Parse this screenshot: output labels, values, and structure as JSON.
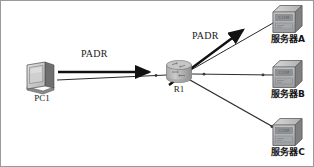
{
  "diagram": {
    "type": "network-topology",
    "width": 314,
    "height": 167,
    "background_color": "#ffffff",
    "border_color": "#9a9a9a"
  },
  "nodes": {
    "pc": {
      "label": "PC1",
      "icon": "desktop-computer-icon",
      "x": 40,
      "y": 75
    },
    "router": {
      "label": "R1",
      "icon": "router-cylinder-icon",
      "x": 178,
      "y": 72
    },
    "server_a": {
      "label": "服务器A",
      "icon": "server-box-icon",
      "face_text": "COM",
      "x": 286,
      "y": 18
    },
    "server_b": {
      "label": "服务器B",
      "icon": "server-box-icon",
      "face_text": "COM",
      "x": 286,
      "y": 73
    },
    "server_c": {
      "label": "服务器C",
      "icon": "server-box-icon",
      "face_text": "COM",
      "x": 286,
      "y": 131
    }
  },
  "flows": [
    {
      "id": "flow-pc-to-router",
      "label": "PADR",
      "from": "pc",
      "to": "router",
      "label_x": 83,
      "label_y": 52
    },
    {
      "id": "flow-router-to-server-a",
      "label": "PADR",
      "from": "router",
      "to": "server_a",
      "label_x": 192,
      "label_y": 33
    }
  ],
  "links": [
    {
      "id": "link-pc-router",
      "from": "pc",
      "to": "router"
    },
    {
      "id": "link-router-server-a",
      "from": "router",
      "to": "server_a"
    },
    {
      "id": "link-router-server-b",
      "from": "router",
      "to": "server_b"
    },
    {
      "id": "link-router-server-c",
      "from": "router",
      "to": "server_c"
    }
  ],
  "colors": {
    "line": "#2b2b2b",
    "arrow": "#111111",
    "device_body": "#b8b8b8",
    "device_shade": "#8e8e8e",
    "device_light": "#d6d6d6",
    "text": "#1a1a1a"
  }
}
